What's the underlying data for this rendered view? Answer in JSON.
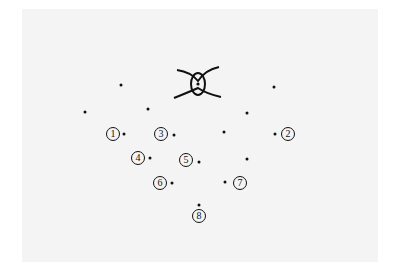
{
  "diagram": {
    "colors": {
      "background": "#ffffff",
      "panel": "#f4f4f4",
      "ink": "#111111"
    },
    "fixation_symbol": {
      "icon": "eye-icon",
      "x": 198,
      "y": 84
    },
    "unlabeled_points": [
      {
        "x": 121,
        "y": 85
      },
      {
        "x": 274,
        "y": 87
      },
      {
        "x": 85,
        "y": 112
      },
      {
        "x": 148,
        "y": 109
      },
      {
        "x": 247,
        "y": 113
      },
      {
        "x": 224,
        "y": 132
      },
      {
        "x": 247,
        "y": 159
      }
    ],
    "labeled_points": [
      {
        "label": "1",
        "x": 124,
        "y": 134,
        "lx": 113,
        "ly": 134
      },
      {
        "label": "2",
        "x": 275,
        "y": 134,
        "lx": 288,
        "ly": 134
      },
      {
        "label": "3",
        "x": 174,
        "y": 135,
        "lx": 161,
        "ly": 134
      },
      {
        "label": "4",
        "x": 150,
        "y": 158,
        "lx": 138,
        "ly": 158
      },
      {
        "label": "5",
        "x": 199,
        "y": 162,
        "lx": 186,
        "ly": 160
      },
      {
        "label": "6",
        "x": 172,
        "y": 183,
        "lx": 160,
        "ly": 183
      },
      {
        "label": "7",
        "x": 225,
        "y": 182,
        "lx": 240,
        "ly": 183
      },
      {
        "label": "8",
        "x": 199,
        "y": 205,
        "lx": 199,
        "ly": 216
      }
    ]
  }
}
